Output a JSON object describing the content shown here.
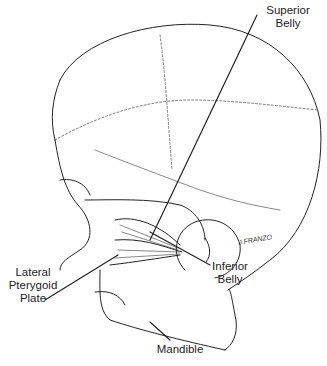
{
  "figure": {
    "labels": {
      "superior_belly": [
        "Superior",
        "Belly"
      ],
      "lateral_pterygoid_plate": [
        "Lateral",
        "Pterygoid",
        "Plate"
      ],
      "inferior_belly": [
        "Inferior",
        "Belly"
      ],
      "mandible": [
        "Mandible"
      ]
    },
    "signature": "J.FRANZO"
  }
}
